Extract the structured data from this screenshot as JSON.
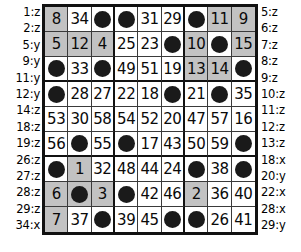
{
  "puzzle": {
    "type": "number-grid-puzzle",
    "grid_size": 9,
    "block_size": 3,
    "colors": {
      "shaded_cell": "#c2c2c2",
      "empty_cell": "#ffffff",
      "dot": "#1a1a1a",
      "grid_line": "#3a3a3a",
      "block_line": "#111111",
      "text": "#0a0a0a"
    },
    "left_labels": [
      "1:z",
      "2:z",
      "5:y",
      "9:y",
      "11:y",
      "12:y",
      "14:z",
      "18:z",
      "19:z",
      "26:z",
      "27:z",
      "28:z",
      "29:z",
      "34:x"
    ],
    "right_labels": [
      "5:z",
      "6:z",
      "7:z",
      "8:z",
      "9:z",
      "10:z",
      "11:z",
      "12:z",
      "13:z",
      "18:x",
      "20:y",
      "22:x",
      "28:x",
      "29:y"
    ],
    "rows": [
      [
        {
          "value": "8",
          "shaded": true,
          "dot": false
        },
        {
          "value": "34",
          "shaded": false,
          "dot": false
        },
        {
          "value": "",
          "shaded": false,
          "dot": true
        },
        {
          "value": "",
          "shaded": false,
          "dot": true
        },
        {
          "value": "31",
          "shaded": false,
          "dot": false
        },
        {
          "value": "29",
          "shaded": false,
          "dot": false
        },
        {
          "value": "",
          "shaded": false,
          "dot": true
        },
        {
          "value": "11",
          "shaded": true,
          "dot": false
        },
        {
          "value": "9",
          "shaded": true,
          "dot": false
        }
      ],
      [
        {
          "value": "5",
          "shaded": true,
          "dot": false
        },
        {
          "value": "12",
          "shaded": true,
          "dot": false
        },
        {
          "value": "4",
          "shaded": true,
          "dot": false
        },
        {
          "value": "25",
          "shaded": false,
          "dot": false
        },
        {
          "value": "23",
          "shaded": false,
          "dot": false
        },
        {
          "value": "",
          "shaded": false,
          "dot": true
        },
        {
          "value": "10",
          "shaded": true,
          "dot": false
        },
        {
          "value": "",
          "shaded": false,
          "dot": true
        },
        {
          "value": "15",
          "shaded": true,
          "dot": false
        }
      ],
      [
        {
          "value": "",
          "shaded": false,
          "dot": true
        },
        {
          "value": "33",
          "shaded": false,
          "dot": false
        },
        {
          "value": "",
          "shaded": false,
          "dot": true
        },
        {
          "value": "49",
          "shaded": false,
          "dot": false
        },
        {
          "value": "51",
          "shaded": false,
          "dot": false
        },
        {
          "value": "19",
          "shaded": false,
          "dot": false
        },
        {
          "value": "13",
          "shaded": true,
          "dot": false
        },
        {
          "value": "14",
          "shaded": true,
          "dot": false
        },
        {
          "value": "",
          "shaded": false,
          "dot": true
        }
      ],
      [
        {
          "value": "",
          "shaded": false,
          "dot": true
        },
        {
          "value": "28",
          "shaded": false,
          "dot": false
        },
        {
          "value": "27",
          "shaded": false,
          "dot": false
        },
        {
          "value": "22",
          "shaded": false,
          "dot": false
        },
        {
          "value": "18",
          "shaded": false,
          "dot": false
        },
        {
          "value": "",
          "shaded": false,
          "dot": true
        },
        {
          "value": "21",
          "shaded": false,
          "dot": false
        },
        {
          "value": "",
          "shaded": false,
          "dot": true
        },
        {
          "value": "35",
          "shaded": false,
          "dot": false
        }
      ],
      [
        {
          "value": "53",
          "shaded": false,
          "dot": false
        },
        {
          "value": "30",
          "shaded": false,
          "dot": false
        },
        {
          "value": "58",
          "shaded": false,
          "dot": false
        },
        {
          "value": "54",
          "shaded": false,
          "dot": false
        },
        {
          "value": "52",
          "shaded": false,
          "dot": false
        },
        {
          "value": "20",
          "shaded": false,
          "dot": false
        },
        {
          "value": "47",
          "shaded": false,
          "dot": false
        },
        {
          "value": "57",
          "shaded": false,
          "dot": false
        },
        {
          "value": "16",
          "shaded": false,
          "dot": false
        }
      ],
      [
        {
          "value": "56",
          "shaded": false,
          "dot": false
        },
        {
          "value": "",
          "shaded": false,
          "dot": true
        },
        {
          "value": "55",
          "shaded": false,
          "dot": false
        },
        {
          "value": "",
          "shaded": false,
          "dot": true
        },
        {
          "value": "17",
          "shaded": false,
          "dot": false
        },
        {
          "value": "43",
          "shaded": false,
          "dot": false
        },
        {
          "value": "50",
          "shaded": false,
          "dot": false
        },
        {
          "value": "59",
          "shaded": false,
          "dot": false
        },
        {
          "value": "",
          "shaded": false,
          "dot": true
        }
      ],
      [
        {
          "value": "",
          "shaded": false,
          "dot": true
        },
        {
          "value": "1",
          "shaded": true,
          "dot": false
        },
        {
          "value": "32",
          "shaded": false,
          "dot": false
        },
        {
          "value": "48",
          "shaded": false,
          "dot": false
        },
        {
          "value": "44",
          "shaded": false,
          "dot": false
        },
        {
          "value": "24",
          "shaded": false,
          "dot": false
        },
        {
          "value": "",
          "shaded": false,
          "dot": true
        },
        {
          "value": "38",
          "shaded": false,
          "dot": false
        },
        {
          "value": "",
          "shaded": false,
          "dot": true
        }
      ],
      [
        {
          "value": "6",
          "shaded": true,
          "dot": false
        },
        {
          "value": "",
          "shaded": true,
          "dot": true
        },
        {
          "value": "3",
          "shaded": true,
          "dot": false
        },
        {
          "value": "",
          "shaded": false,
          "dot": true
        },
        {
          "value": "42",
          "shaded": false,
          "dot": false
        },
        {
          "value": "46",
          "shaded": false,
          "dot": false
        },
        {
          "value": "2",
          "shaded": true,
          "dot": false
        },
        {
          "value": "36",
          "shaded": false,
          "dot": false
        },
        {
          "value": "40",
          "shaded": false,
          "dot": false
        }
      ],
      [
        {
          "value": "7",
          "shaded": true,
          "dot": false
        },
        {
          "value": "37",
          "shaded": false,
          "dot": false
        },
        {
          "value": "",
          "shaded": false,
          "dot": true
        },
        {
          "value": "39",
          "shaded": false,
          "dot": false
        },
        {
          "value": "45",
          "shaded": false,
          "dot": false
        },
        {
          "value": "",
          "shaded": false,
          "dot": true
        },
        {
          "value": "",
          "shaded": false,
          "dot": true
        },
        {
          "value": "26",
          "shaded": false,
          "dot": false
        },
        {
          "value": "41",
          "shaded": false,
          "dot": false
        }
      ]
    ]
  }
}
